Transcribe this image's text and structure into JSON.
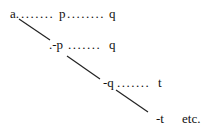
{
  "rows": [
    {
      "head": "a.",
      "dots1": ".......",
      "mid": "p",
      "dots2": "........",
      "end": "q"
    },
    {
      "head": ".-p",
      "dots1": ".......",
      "end": "q"
    },
    {
      "head": "-q",
      "dots1": ".......",
      "end": "t"
    },
    {
      "head": "-t",
      "end": "etc."
    }
  ]
}
